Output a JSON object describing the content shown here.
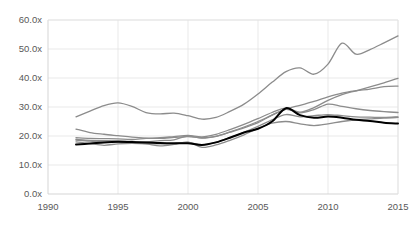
{
  "chart_data": {
    "type": "line",
    "title": "",
    "subtitle": "",
    "xlabel": "",
    "ylabel": "",
    "xlim": [
      1990,
      2015
    ],
    "ylim": [
      0,
      60
    ],
    "grid": true,
    "legend": "none",
    "y_ticks": [
      0,
      10,
      20,
      30,
      40,
      50,
      60
    ],
    "y_tick_labels": [
      "0.0x",
      "10.0x",
      "20.0x",
      "30.0x",
      "40.0x",
      "50.0x",
      "60.0x"
    ],
    "x_ticks": [
      1990,
      1995,
      2000,
      2005,
      2010,
      2015
    ],
    "x_tick_labels": [
      "1990",
      "1995",
      "2000",
      "2005",
      "2010",
      "2015"
    ],
    "x": [
      1992,
      1993,
      1994,
      1995,
      1996,
      1997,
      1998,
      1999,
      2000,
      2001,
      2002,
      2003,
      2004,
      2005,
      2006,
      2007,
      2008,
      2009,
      2010,
      2011,
      2012,
      2013,
      2014,
      2015
    ],
    "series": [
      {
        "name": "series-1-top-gray",
        "color": "#8c8c8c",
        "width": 1.3,
        "values": [
          26.6,
          28.6,
          30.5,
          31.4,
          30.2,
          28.1,
          27.6,
          27.9,
          27.0,
          25.8,
          26.4,
          28.5,
          31.0,
          34.5,
          38.5,
          42.2,
          43.5,
          41.3,
          44.8,
          52.0,
          48.2,
          49.8,
          52.1,
          54.5
        ]
      },
      {
        "name": "series-2-gray",
        "color": "#8c8c8c",
        "width": 1.3,
        "values": [
          22.4,
          21.2,
          20.6,
          20.1,
          19.6,
          19.3,
          19.2,
          19.5,
          19.8,
          19.4,
          19.9,
          21.4,
          23.1,
          25.0,
          27.2,
          29.3,
          30.6,
          31.9,
          33.5,
          34.8,
          35.6,
          36.2,
          37.0,
          37.2
        ]
      },
      {
        "name": "series-3-gray",
        "color": "#8c8c8c",
        "width": 1.3,
        "values": [
          19.4,
          19.2,
          19.1,
          19.0,
          18.8,
          19.2,
          19.4,
          19.8,
          20.2,
          19.7,
          20.6,
          22.2,
          24.0,
          26.0,
          28.1,
          29.6,
          28.2,
          29.8,
          32.3,
          34.3,
          35.6,
          36.9,
          38.3,
          39.9
        ]
      },
      {
        "name": "series-4-gray",
        "color": "#8c8c8c",
        "width": 1.3,
        "values": [
          18.8,
          18.5,
          18.4,
          18.3,
          18.1,
          18.0,
          18.4,
          18.7,
          20.0,
          19.3,
          19.9,
          21.3,
          22.8,
          24.6,
          27.2,
          29.2,
          28.0,
          29.1,
          31.0,
          30.2,
          29.4,
          28.8,
          28.4,
          28.1
        ]
      },
      {
        "name": "series-5-gray",
        "color": "#8c8c8c",
        "width": 1.3,
        "values": [
          18.0,
          17.4,
          16.8,
          17.3,
          17.5,
          17.3,
          16.6,
          17.1,
          17.9,
          16.1,
          16.9,
          18.5,
          20.4,
          22.6,
          24.4,
          25.0,
          24.2,
          23.6,
          24.2,
          25.0,
          25.6,
          25.9,
          26.2,
          26.4
        ]
      },
      {
        "name": "series-6-gray",
        "color": "#8c8c8c",
        "width": 1.3,
        "values": [
          18.6,
          18.2,
          18.0,
          17.9,
          17.6,
          17.4,
          17.3,
          17.4,
          17.8,
          17.0,
          17.8,
          19.5,
          21.3,
          23.3,
          25.6,
          27.4,
          26.6,
          27.0,
          27.4,
          27.0,
          26.6,
          26.5,
          26.4,
          26.6
        ]
      },
      {
        "name": "series-7-black-highlight",
        "color": "#000000",
        "width": 2.0,
        "values": [
          17.1,
          17.4,
          17.8,
          18.0,
          17.9,
          17.8,
          17.6,
          17.5,
          17.5,
          16.9,
          17.8,
          19.4,
          21.2,
          22.5,
          25.0,
          29.6,
          27.2,
          26.3,
          26.7,
          26.3,
          25.6,
          25.2,
          24.6,
          24.3
        ]
      }
    ]
  }
}
